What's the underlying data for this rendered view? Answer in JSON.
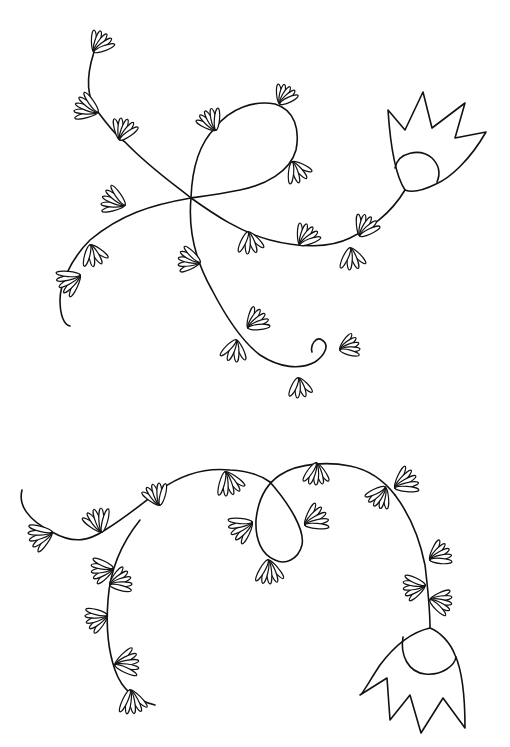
{
  "image": {
    "description": "Black ink line drawing on white paper: two flowering vine motifs, each with many small fan-shaped leaf clusters and a single bell-shaped flower with a round center.",
    "colors": {
      "ink": "#111111",
      "paper": "#ffffff"
    },
    "motifs": [
      {
        "name": "upper-vine",
        "flower_orientation": "upright",
        "loops": 1
      },
      {
        "name": "lower-vine",
        "flower_orientation": "hanging",
        "loops": 1
      }
    ]
  }
}
